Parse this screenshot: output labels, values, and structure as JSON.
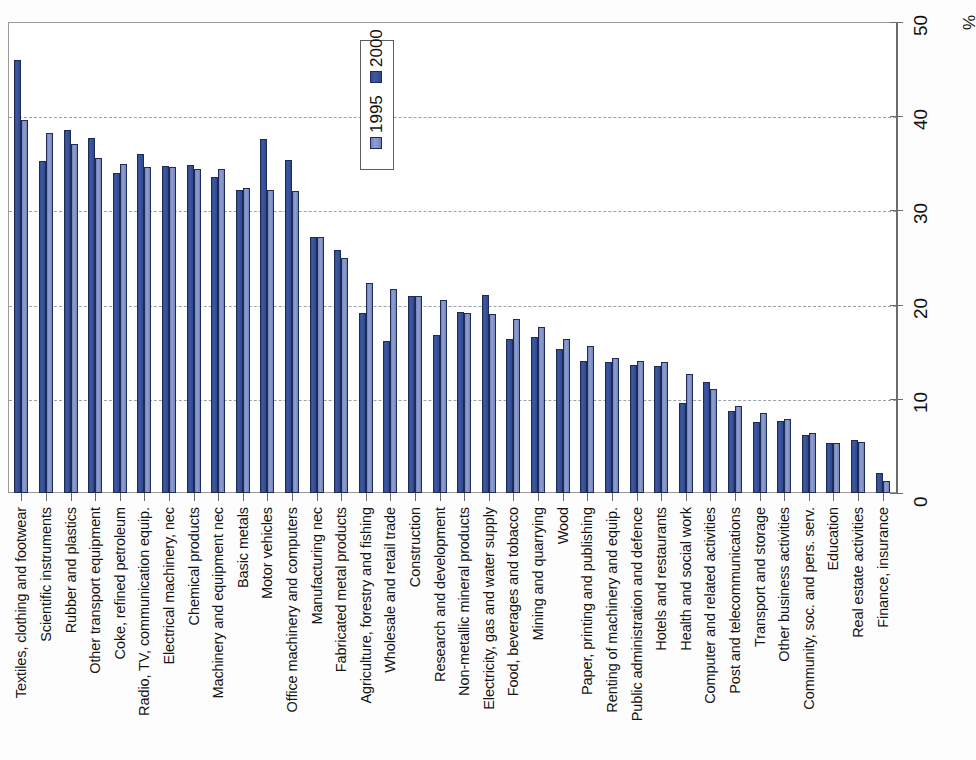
{
  "chart_data": {
    "type": "bar",
    "title": "",
    "subtitle": "",
    "xlabel": "",
    "ylabel": "%",
    "axis_unit_label": "%",
    "ylim": [
      0,
      50
    ],
    "ytick_values": [
      0,
      10,
      20,
      30,
      40,
      50
    ],
    "ytick_labels": [
      "0",
      "10",
      "20",
      "30",
      "40",
      "50"
    ],
    "grid": true,
    "gridlines_at": [
      10,
      20,
      30,
      40
    ],
    "legend_position": "inside-top-center",
    "orientation": "vertical-bars-rotated-page",
    "colors": {
      "series_1995": "#7183bf",
      "series_2000": "#2e4a96",
      "bar_outline": "#1c2c55",
      "axis": "#6b6b6b",
      "gridline": "#9aa3ac",
      "background": "#ffffff"
    },
    "categories": [
      "Textiles, clothing and footwear",
      "Scientific instruments",
      "Rubber and plastics",
      "Other transport equipment",
      "Coke, refined petroleum",
      "Radio, TV, communication equip.",
      "Electrical machinery, nec",
      "Chemical products",
      "Machinery and equipment nec",
      "Basic metals",
      "Motor vehicles",
      "Office machinery and computers",
      "Manufacturing nec",
      "Fabricated metal products",
      "Agriculture, forestry and fishing",
      "Wholesale and retail trade",
      "Construction",
      "Research and development",
      "Non-metallic mineral products",
      "Electricity, gas and water supply",
      "Food, beverages and tobacco",
      "Mining and quarrying",
      "Wood",
      "Paper, printing and publishing",
      "Renting of machinery and equip.",
      "Public administration and defence",
      "Hotels and restaurants",
      "Health and social work",
      "Computer and related activities",
      "Post and telecommunications",
      "Transport and storage",
      "Other business activities",
      "Community, soc. and pers. serv.",
      "Education",
      "Real estate activities",
      "Finance, insurance"
    ],
    "series": [
      {
        "name": "1995",
        "values": [
          46.0,
          35.2,
          38.5,
          37.7,
          34.0,
          36.0,
          34.7,
          34.8,
          33.6,
          32.2,
          37.6,
          35.4,
          27.2,
          25.8,
          19.1,
          16.1,
          20.9,
          16.8,
          19.2,
          21.0,
          16.3,
          16.6,
          15.3,
          14.0,
          13.9,
          13.6,
          13.5,
          9.6,
          11.8,
          8.7,
          7.5,
          7.6,
          6.2,
          5.3,
          5.6,
          2.1
        ]
      },
      {
        "name": "2000",
        "values": [
          39.6,
          38.2,
          37.1,
          35.6,
          34.9,
          34.6,
          34.6,
          34.4,
          34.4,
          32.4,
          32.2,
          32.1,
          27.2,
          25.0,
          22.3,
          21.7,
          20.9,
          20.5,
          19.1,
          19.0,
          18.5,
          17.6,
          16.4,
          15.6,
          14.3,
          14.0,
          13.9,
          12.6,
          11.0,
          9.2,
          8.5,
          7.9,
          6.4,
          5.3,
          5.4,
          1.3
        ]
      }
    ],
    "legend": [
      {
        "label": "1995",
        "series": "1995"
      },
      {
        "label": "2000",
        "series": "2000"
      }
    ]
  }
}
